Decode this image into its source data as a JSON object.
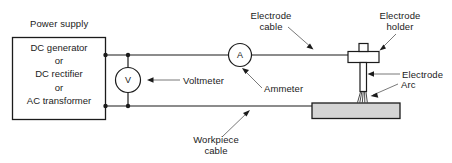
{
  "diagram": {
    "power_supply": {
      "caption": "Power supply",
      "lines": [
        "DC generator",
        "or",
        "DC rectifier",
        "or",
        "AC transformer"
      ]
    },
    "meters": {
      "voltmeter": {
        "symbol": "V",
        "label": "Voltmeter"
      },
      "ammeter": {
        "symbol": "A",
        "label": "Ammeter"
      }
    },
    "labels": {
      "electrode_cable": "Electrode\ncable",
      "electrode_cable_line1": "Electrode",
      "electrode_cable_line2": "cable",
      "electrode_holder_line1": "Electrode",
      "electrode_holder_line2": "holder",
      "electrode": "Electrode",
      "arc": "Arc",
      "workpiece_cable_line1": "Workpiece",
      "workpiece_cable_line2": "cable"
    },
    "colors": {
      "line": "#1b1b1b",
      "text": "#1b1b1b",
      "workpiece_fill": "#d4d4d4",
      "holder_fill": "#ffffff",
      "background": "#ffffff"
    }
  }
}
